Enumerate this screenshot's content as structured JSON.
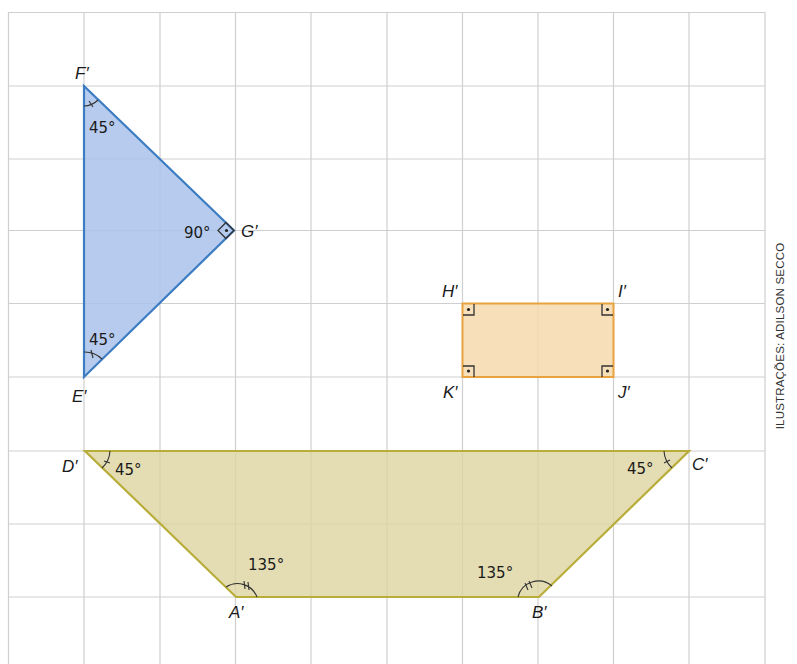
{
  "figure": {
    "credit": "ILUSTRAÇÕES: ADILSON SECCO",
    "grid": {
      "origin_x": 8.5,
      "origin_y": 12.5,
      "cell_w": 75.6,
      "cell_h": 73.3,
      "cols": 10,
      "rows": 9,
      "color": "#c9c9c9"
    },
    "colors": {
      "triangle_fill": "#b3c8ea",
      "triangle_stroke": "#3b7cc2",
      "rectangle_fill": "#f7dcb4",
      "rectangle_stroke": "#e8a33e",
      "trapezoid_fill": "#e3dcb2",
      "trapezoid_stroke": "#b9ad3a"
    },
    "triangle": {
      "vertices": {
        "F": "F′",
        "G": "G′",
        "E": "E′"
      },
      "angles": {
        "F": "45°",
        "G": "90°",
        "E": "45°"
      }
    },
    "rectangle": {
      "vertices": {
        "H": "H′",
        "I": "I′",
        "J": "J′",
        "K": "K′"
      }
    },
    "trapezoid": {
      "vertices": {
        "A": "A′",
        "B": "B′",
        "C": "C′",
        "D": "D′"
      },
      "angles": {
        "A": "135°",
        "B": "135°",
        "C": "45°",
        "D": "45°"
      }
    }
  }
}
